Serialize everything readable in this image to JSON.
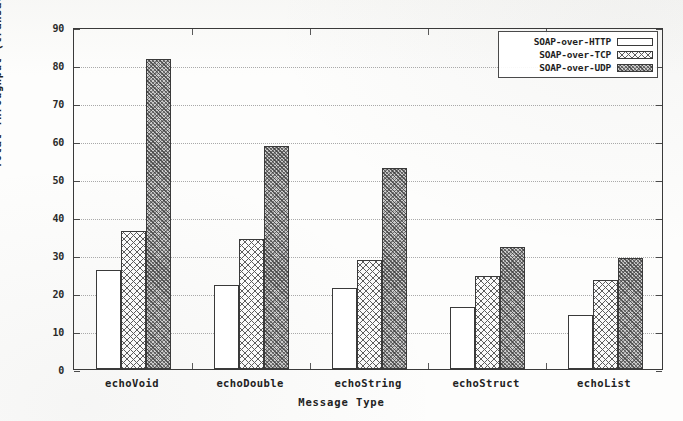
{
  "chart_data": {
    "type": "bar",
    "title": "",
    "xlabel": "Message Type",
    "ylabel": "Total Throughput (transactions/s)",
    "ylim": [
      0,
      90
    ],
    "ytick_step": 10,
    "yticks": [
      "0",
      "10",
      "20",
      "30",
      "40",
      "50",
      "60",
      "70",
      "80",
      "90"
    ],
    "grid": true,
    "legend_position": "top-right",
    "categories": [
      "echoVoid",
      "echoDouble",
      "echoString",
      "echoStruct",
      "echoList"
    ],
    "series": [
      {
        "name": "SOAP-over-HTTP",
        "pattern": "plain",
        "values": [
          26,
          22,
          21.3,
          16.4,
          14.3
        ]
      },
      {
        "name": "SOAP-over-TCP",
        "pattern": "cross-hatch",
        "values": [
          36.3,
          34.3,
          28.7,
          24.4,
          23.4
        ]
      },
      {
        "name": "SOAP-over-UDP",
        "pattern": "stipple",
        "values": [
          81.7,
          58.8,
          52.8,
          32.1,
          29.1
        ]
      }
    ]
  },
  "colors": {
    "frame": "#3a3a3a",
    "grid": "#a9a9a9",
    "text": "#222222",
    "bar_plain": "#ffffff",
    "bar_cross": "#fbfbfb",
    "bar_stipple": "#cfcfcf",
    "background": "#fdfdfc"
  }
}
